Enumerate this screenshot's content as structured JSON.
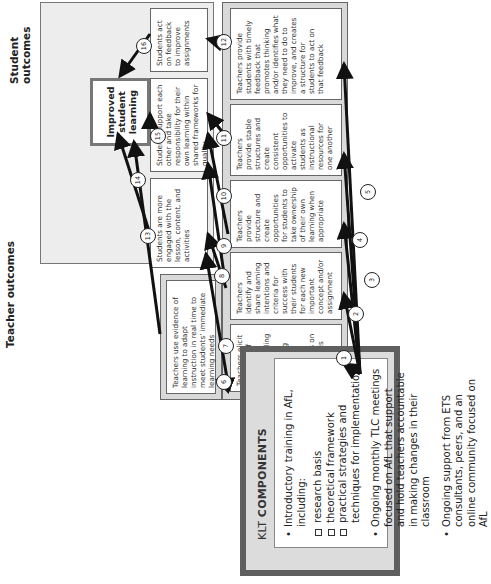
{
  "klt": {
    "title_prefix": "KLT",
    "title_main": "COMPONENTS",
    "items": [
      {
        "text": "Introductory training in AfL, including:",
        "subitems": [
          "research basis",
          "theoretical framework",
          "practical strategies and techniques for implementation"
        ]
      },
      {
        "text": "Ongoing monthly TLC meetings focused on AfL that support and hold teachers accountable in making changes in their classroom"
      },
      {
        "text": "Ongoing support from ETS consultants, peers, and an online community focused on AfL"
      }
    ]
  },
  "teacher_outcomes": {
    "title": "Teacher outcomes",
    "boxes": [
      "Teachers elicit evidence of student understanding through engineering effective classroom discussions on a daily basis",
      "Teachers identify and share learning intentions and criteria for success with their students for each new important concept and/or assignment",
      "Teachers provide structure and create opportunities for students to take ownership of their own learning when appropriate",
      "Teachers provide stable structures and create consistent opportunities to activate students as instructional resources for one another",
      "Teachers provide students with timely feedback that promotes thinking and/or identifies what they need to do to improve, and creates a structure for students to act on that feedback"
    ],
    "upper_box": "Teachers use evidence of learning to adapt instruction in real time to meet students' immediate learning needs"
  },
  "student_outcomes": {
    "title": "Student outcomes",
    "final": "Improved student learning",
    "boxes": [
      "Students are more engaged with the lesson, content, and activities",
      "Students support each other and take responsibility for their own learning within shared frameworks for quality",
      "Students act on feedback to improve assignments"
    ]
  },
  "connectors": [
    "1",
    "2",
    "3",
    "4",
    "5",
    "6",
    "7",
    "8",
    "9",
    "10",
    "11",
    "12",
    "13",
    "14",
    "15",
    "16"
  ],
  "colors": {
    "panel_dark": "#5f5f5f",
    "panel_light": "#d9d9d9",
    "student_panel": "#ededed",
    "line": "#111111"
  }
}
